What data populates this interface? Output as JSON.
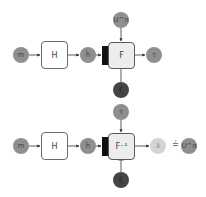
{
  "top_row": {
    "input": "m",
    "encoder": "H",
    "hidden": "ĥ",
    "function": "F",
    "key_input": "U^π",
    "noise": "ξ",
    "output": "τ"
  },
  "bottom_row": {
    "input": "m",
    "encoder": "H",
    "hidden": "ĥ",
    "function": "F⁻¹",
    "key_input": "τ",
    "noise": "ξ",
    "output": "x̂",
    "compare_symbol": "≟",
    "target": "U^π"
  },
  "colors": {
    "node_mid": "#8f8f8f",
    "node_dark": "#454545",
    "node_light": "#d4d4d4",
    "box_border": "#6a6a6a",
    "bar": "#111111"
  }
}
